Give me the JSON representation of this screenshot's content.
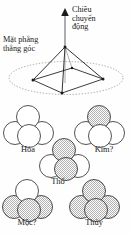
{
  "figure": {
    "title_absent": true,
    "annotations": {
      "motion_direction": "Chiều\nchuyển\nđộng",
      "motion_direction_lines": [
        "Chiều",
        "chuyển",
        "động"
      ],
      "perpendicular_plane": "Mặt phẳng\nthẳng góc",
      "perpendicular_plane_lines": [
        "Mặt phẳng",
        "thẳng góc"
      ]
    },
    "colors": {
      "stroke": "#1a1a1a",
      "dotted_plane": "#8a8a8a",
      "shaded_fill": "#b8b8b8",
      "white_fill": "#ffffff",
      "text": "#1a1a1a"
    }
  },
  "pyramid": {
    "name": "square-base-pyramid",
    "apex": {
      "x": 65,
      "y": 47
    },
    "base_vertices": [
      {
        "x": 33,
        "y": 80
      },
      {
        "x": 62,
        "y": 93
      },
      {
        "x": 103,
        "y": 79
      },
      {
        "x": 72,
        "y": 68
      }
    ],
    "arrow": {
      "from_y": 47,
      "to_y": 11,
      "x": 65,
      "label": "Chiều chuyển động"
    },
    "plane_ellipse": {
      "cx": 66,
      "cy": 78,
      "rx": 58,
      "ry": 17
    }
  },
  "clusters": [
    {
      "id": "hoa",
      "label": "Hỏa",
      "shaded_count": 0,
      "spheres": [
        {
          "pos": "top",
          "shaded": false
        },
        {
          "pos": "bottom-left",
          "shaded": false
        },
        {
          "pos": "bottom-mid",
          "shaded": false
        },
        {
          "pos": "bottom-right",
          "shaded": false
        }
      ]
    },
    {
      "id": "kim",
      "label": "Kim?",
      "shaded_count": 1,
      "spheres": [
        {
          "pos": "top",
          "shaded": true
        },
        {
          "pos": "bottom-left",
          "shaded": false
        },
        {
          "pos": "bottom-mid",
          "shaded": false
        },
        {
          "pos": "bottom-right",
          "shaded": false
        }
      ]
    },
    {
      "id": "tho",
      "label": "Thổ",
      "shaded_count": 2,
      "spheres": [
        {
          "pos": "top",
          "shaded": true
        },
        {
          "pos": "bottom-left",
          "shaded": false
        },
        {
          "pos": "bottom-mid",
          "shaded": true
        },
        {
          "pos": "bottom-right",
          "shaded": false
        }
      ]
    },
    {
      "id": "moc",
      "label": "Mộc?",
      "shaded_count": 3,
      "spheres": [
        {
          "pos": "top",
          "shaded": false
        },
        {
          "pos": "bottom-left",
          "shaded": true
        },
        {
          "pos": "bottom-mid",
          "shaded": true
        },
        {
          "pos": "bottom-right",
          "shaded": true
        }
      ]
    },
    {
      "id": "thuy",
      "label": "Thủy",
      "shaded_count": 4,
      "spheres": [
        {
          "pos": "top",
          "shaded": true
        },
        {
          "pos": "bottom-left",
          "shaded": true
        },
        {
          "pos": "bottom-mid",
          "shaded": true
        },
        {
          "pos": "bottom-right",
          "shaded": true
        }
      ]
    }
  ]
}
